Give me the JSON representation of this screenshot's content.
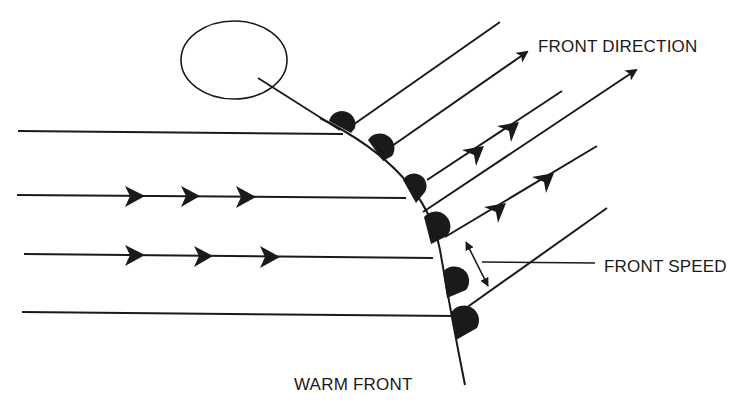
{
  "diagram": {
    "type": "weather-front-schematic",
    "labels": {
      "front_direction": "FRONT DIRECTION",
      "front_speed": "FRONT SPEED",
      "warm_front": "WARM FRONT"
    },
    "elements": {
      "front_symbol_count": 6,
      "horizontal_streamlines": 4,
      "diagonal_streamlines": 6,
      "label_circle": true
    },
    "colors": {
      "ink": "#1a1a1a",
      "background": "#ffffff"
    }
  }
}
